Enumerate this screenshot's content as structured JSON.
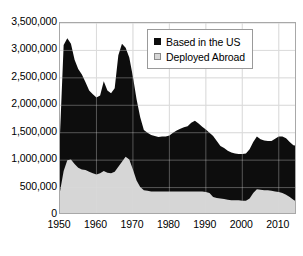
{
  "chart_data": {
    "type": "area",
    "stacked": true,
    "title": "",
    "subtitle": "",
    "xlabel": "",
    "ylabel": "",
    "xlim": [
      1950,
      2015
    ],
    "ylim": [
      0,
      3500000
    ],
    "grid": true,
    "legend_position": "top-right",
    "y_ticks": [
      0,
      500000,
      1000000,
      1500000,
      2000000,
      2500000,
      3000000,
      3500000
    ],
    "y_tick_labels": [
      "0",
      "500,000",
      "1,000,000",
      "1,500,000",
      "2,000,000",
      "2,500,000",
      "3,000,000",
      "3,500,000"
    ],
    "x_ticks": [
      1950,
      1960,
      1970,
      1980,
      1990,
      2000,
      2010
    ],
    "x_tick_labels": [
      "1950",
      "1960",
      "1970",
      "1980",
      "1990",
      "2000",
      "2010"
    ],
    "colors": {
      "based_in_the_us": "#0d0d0d",
      "deployed_abroad": "#d6d6d6",
      "frame": "#a8a8a8",
      "gridline": "#dcdcdc",
      "text": "#000000"
    },
    "x": [
      1950,
      1951,
      1952,
      1953,
      1954,
      1955,
      1956,
      1957,
      1958,
      1959,
      1960,
      1961,
      1962,
      1963,
      1964,
      1965,
      1966,
      1967,
      1968,
      1969,
      1970,
      1971,
      1972,
      1973,
      1974,
      1975,
      1976,
      1977,
      1978,
      1979,
      1980,
      1981,
      1982,
      1983,
      1984,
      1985,
      1986,
      1987,
      1988,
      1989,
      1990,
      1991,
      1992,
      1993,
      1994,
      1995,
      1996,
      1997,
      1998,
      1999,
      2000,
      2001,
      2002,
      2003,
      2004,
      2005,
      2006,
      2007,
      2008,
      2009,
      2010,
      2011,
      2012,
      2013,
      2014,
      2015
    ],
    "series": [
      {
        "name": "Deployed Abroad",
        "color": "#d6d6d6",
        "values": [
          430000,
          800000,
          1000000,
          1010000,
          930000,
          860000,
          830000,
          820000,
          790000,
          760000,
          740000,
          760000,
          800000,
          770000,
          760000,
          790000,
          880000,
          970000,
          1060000,
          1010000,
          830000,
          630000,
          510000,
          450000,
          440000,
          430000,
          430000,
          430000,
          430000,
          430000,
          430000,
          430000,
          430000,
          430000,
          430000,
          430000,
          430000,
          430000,
          430000,
          430000,
          420000,
          400000,
          330000,
          310000,
          300000,
          290000,
          280000,
          270000,
          270000,
          270000,
          260000,
          260000,
          300000,
          400000,
          470000,
          460000,
          450000,
          450000,
          440000,
          430000,
          420000,
          400000,
          370000,
          330000,
          280000,
          240000
        ]
      },
      {
        "name": "Based in the US",
        "color": "#0d0d0d",
        "values": [
          1040000,
          2300000,
          2220000,
          2110000,
          1900000,
          1800000,
          1730000,
          1600000,
          1480000,
          1440000,
          1400000,
          1420000,
          1640000,
          1500000,
          1460000,
          1520000,
          2030000,
          2150000,
          1990000,
          1860000,
          1690000,
          1480000,
          1270000,
          1100000,
          1060000,
          1030000,
          1010000,
          990000,
          1000000,
          1000000,
          1020000,
          1070000,
          1110000,
          1140000,
          1170000,
          1190000,
          1250000,
          1290000,
          1240000,
          1180000,
          1140000,
          1100000,
          1110000,
          1040000,
          960000,
          930000,
          890000,
          870000,
          850000,
          840000,
          850000,
          860000,
          900000,
          930000,
          960000,
          920000,
          910000,
          900000,
          910000,
          960000,
          1010000,
          1030000,
          1030000,
          1000000,
          990000,
          1020000
        ]
      }
    ],
    "annotations": [
      {
        "label": "Korean War peak",
        "year": 1952,
        "total": 3220000
      },
      {
        "label": "Vietnam War peak",
        "year": 1968,
        "total": 3050000
      },
      {
        "label": "Cold War drawdown trough",
        "year": 1999,
        "total": 1110000
      }
    ]
  },
  "legend": {
    "items": [
      {
        "label": "Based in the US",
        "swatch": "filled-square",
        "color": "#0d0d0d"
      },
      {
        "label": "Deployed Abroad",
        "swatch": "outlined-square",
        "color": "#d6d6d6"
      }
    ]
  }
}
